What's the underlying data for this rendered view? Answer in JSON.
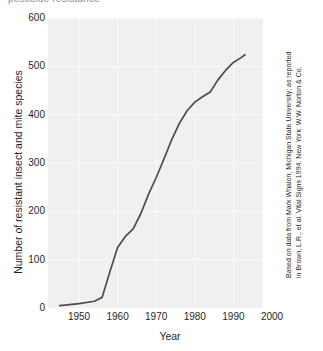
{
  "clipped_caption": "pesticide resistance",
  "colors": {
    "plot_background": "#f0f0f0",
    "gridline": "#fafafa",
    "series_line": "#4d4d4d",
    "text": "#1f1f1f"
  },
  "source_note": {
    "line1": "Based on data from Mark Whalon, Michigan State University; as reported",
    "line2": "in Brown, L.R., et al. Vital Signs 1994. New York: W.W. Norton & Co."
  },
  "chart_data": {
    "type": "line",
    "title": "",
    "xlabel": "Year",
    "ylabel": "Number of resistant insect and mite species",
    "xlim": [
      1942,
      1997.7
    ],
    "ylim": [
      0,
      600
    ],
    "grid": true,
    "legend": "none",
    "xticks": [
      1950,
      1960,
      1970,
      1980,
      1990,
      2000
    ],
    "xtick_labels": [
      "1950",
      "1960",
      "1970",
      "1980",
      "1990",
      "2000"
    ],
    "yticks": [
      0,
      100,
      200,
      300,
      400,
      500,
      600
    ],
    "ytick_labels": [
      "0",
      "100",
      "200",
      "300",
      "400",
      "500",
      "600"
    ],
    "series": [
      {
        "name": "Resistant insect and mite species",
        "x": [
          1945,
          1950,
          1954,
          1956,
          1958,
          1960,
          1962,
          1964,
          1966,
          1968,
          1970,
          1972,
          1974,
          1976,
          1978,
          1980,
          1982,
          1984,
          1986,
          1988,
          1990,
          1992,
          1993
        ],
        "values": [
          5,
          9,
          14,
          22,
          75,
          125,
          148,
          163,
          195,
          235,
          270,
          308,
          348,
          382,
          408,
          426,
          437,
          447,
          472,
          492,
          508,
          518,
          524
        ]
      }
    ]
  },
  "plot_geometry": {
    "left": 48,
    "right": 263,
    "top": 18,
    "bottom": 308,
    "x_ref_year": 1950,
    "x_ref_px": 79,
    "px_per_year": 3.86,
    "y_ref_value": 0,
    "y_ref_px": 308,
    "px_per_unit": 0.483333
  }
}
